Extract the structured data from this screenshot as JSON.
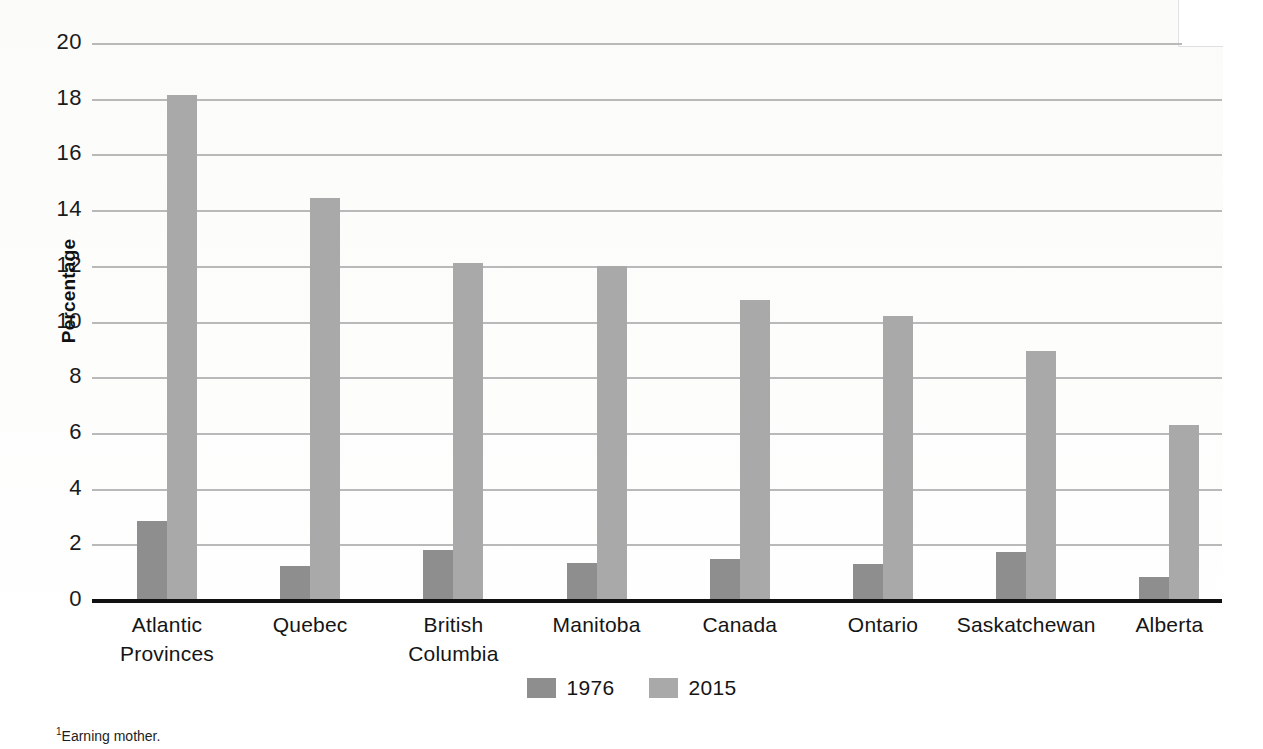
{
  "chart_data": {
    "type": "bar",
    "title": "",
    "subtitle": "",
    "xlabel": "",
    "ylabel": "Percentage",
    "ylim": [
      0,
      20
    ],
    "ytick_step": 2,
    "yticks": [
      "20",
      "18",
      "16",
      "14",
      "12",
      "10",
      "8",
      "6",
      "4",
      "2",
      "0"
    ],
    "grid": true,
    "legend_position": "bottom-center",
    "categories": [
      "Atlantic\nProvinces",
      "Quebec",
      "British\nColumbia",
      "Manitoba",
      "Canada",
      "Ontario",
      "Saskatchewan",
      "Alberta"
    ],
    "category_lines": [
      [
        "Atlantic",
        "Provinces"
      ],
      [
        "Quebec",
        ""
      ],
      [
        "British",
        "Columbia"
      ],
      [
        "Manitoba",
        ""
      ],
      [
        "Canada",
        ""
      ],
      [
        "Ontario",
        ""
      ],
      [
        "Saskatchewan",
        ""
      ],
      [
        "Alberta",
        ""
      ]
    ],
    "series": [
      {
        "name": "1976",
        "color": "#8e8e8e",
        "values": [
          2.8,
          1.2,
          1.75,
          1.3,
          1.45,
          1.25,
          1.7,
          0.8
        ]
      },
      {
        "name": "2015",
        "color": "#a9a9a9",
        "values": [
          18.1,
          14.4,
          12.05,
          11.95,
          10.75,
          10.15,
          8.9,
          6.25
        ]
      }
    ]
  },
  "legend": {
    "entries": [
      {
        "label": "1976",
        "swatch": "legend-swatch-1976"
      },
      {
        "label": "2015",
        "swatch": "legend-swatch-2015"
      }
    ]
  },
  "footnote": {
    "marker": "1",
    "text": "Earning mother."
  }
}
